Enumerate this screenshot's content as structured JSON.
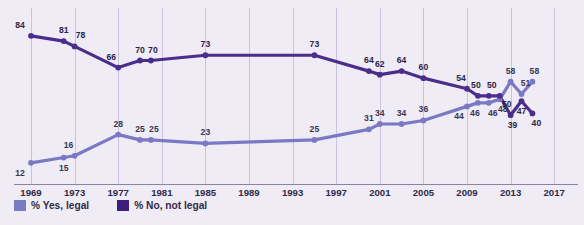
{
  "chart_data": {
    "type": "line",
    "title": "",
    "subtitle": "",
    "xlabel": "",
    "ylabel": "",
    "xlim": [
      1968,
      2018
    ],
    "ylim": [
      0,
      100
    ],
    "grid": "vertical",
    "legend_position": "bottom-left",
    "xticks": [
      "1969",
      "1973",
      "1977",
      "1981",
      "1985",
      "1989",
      "1993",
      "1997",
      "2001",
      "2005",
      "2009",
      "2013",
      "2017"
    ],
    "xtick_values": [
      1969,
      1973,
      1977,
      1981,
      1985,
      1989,
      1993,
      1997,
      2001,
      2005,
      2009,
      2013,
      2017
    ],
    "series": [
      {
        "name": "% Yes, legal",
        "color": "#7b79c4",
        "x": [
          1969,
          1972,
          1973,
          1977,
          1979,
          1980,
          1985,
          1995,
          2000,
          2001,
          2003,
          2005,
          2009,
          2010,
          2011,
          2012,
          2013,
          2014,
          2015
        ],
        "values": [
          12,
          15,
          16,
          28,
          25,
          25,
          23,
          25,
          31,
          34,
          34,
          36,
          44,
          46,
          46,
          48,
          58,
          51,
          58
        ],
        "labels": [
          "12",
          "15",
          "16",
          "28",
          "25",
          "25",
          "23",
          "25",
          "31",
          "34",
          "34",
          "36",
          "44",
          "46",
          "46",
          "48",
          "58",
          "51",
          "58"
        ]
      },
      {
        "name": "% No, not legal",
        "color": "#4b2d8c",
        "x": [
          1969,
          1972,
          1973,
          1977,
          1979,
          1980,
          1985,
          1995,
          2000,
          2001,
          2003,
          2005,
          2009,
          2010,
          2011,
          2012,
          2013,
          2014,
          2015
        ],
        "values": [
          84,
          81,
          78,
          66,
          70,
          70,
          73,
          73,
          64,
          62,
          64,
          60,
          54,
          50,
          50,
          50,
          39,
          47,
          40
        ],
        "labels": [
          "84",
          "81",
          "78",
          "66",
          "70",
          "70",
          "73",
          "73",
          "64",
          "62",
          "64",
          "60",
          "54",
          "50",
          "50",
          "50",
          "39",
          "47",
          "40"
        ]
      }
    ]
  },
  "legend": {
    "items": [
      {
        "label": "% Yes, legal",
        "color": "#7b79c4"
      },
      {
        "label": "% No, not legal",
        "color": "#3b1f7a"
      }
    ]
  },
  "colors": {
    "background": "#efecf5",
    "gridline": "#c9c3dd",
    "axis": "#8a82a8",
    "yes_series": "#7b79c4",
    "no_series": "#4b2d8c",
    "label_text": "#2f2a47"
  }
}
